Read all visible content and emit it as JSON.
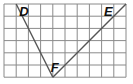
{
  "grid": {
    "columns": 10,
    "rows": 6,
    "origin_x": 4,
    "origin_y": 4,
    "cell_w": 12.2,
    "cell_h": 12.2,
    "line_color": "#8a8a8a"
  },
  "triangle": {
    "stroke_color": "#555555",
    "vertices": [
      {
        "name": "D",
        "label": "D",
        "col": 1,
        "row": 0,
        "label_dx": 3,
        "label_dy": 12
      },
      {
        "name": "E",
        "label": "E",
        "col": 10,
        "row": 0,
        "label_dx": -22,
        "label_dy": 12
      },
      {
        "name": "F",
        "label": "F",
        "col": 4,
        "row": 6,
        "label_dx": -2,
        "label_dy": -5
      }
    ]
  }
}
